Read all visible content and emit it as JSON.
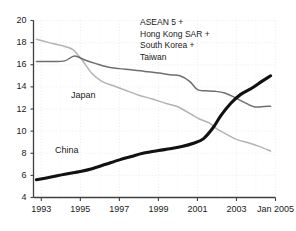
{
  "chart_data": {
    "type": "line",
    "title": "",
    "subtitle": "",
    "xlabel": "",
    "ylabel": "",
    "xlim": [
      1992.6,
      2005.0
    ],
    "ylim": [
      4,
      20
    ],
    "grid": true,
    "grid_style": "dotted",
    "legend_position": "inline-labels",
    "y_ticks": [
      "20",
      "18",
      "16",
      "14",
      "12",
      "10",
      "8",
      "6",
      "4"
    ],
    "y_tick_values": [
      20,
      18,
      16,
      14,
      12,
      10,
      8,
      6,
      4
    ],
    "x_ticks": [
      "1993",
      "1995",
      "1997",
      "1999",
      "2001",
      "2003",
      "Jan 2005"
    ],
    "x_tick_values": [
      1993,
      1995,
      1997,
      1999,
      2001,
      2003,
      2005
    ],
    "annotations": [
      {
        "name": "asean-group-annotation",
        "lines": [
          "ASEAN 5 +",
          "Hong Kong SAR +",
          "South Korea +",
          "Taiwan"
        ]
      }
    ],
    "series": [
      {
        "name": "China",
        "label": "China",
        "color": "#111111",
        "width": 3.1,
        "x": [
          1992.75,
          1993.5,
          1994.2,
          1995.0,
          1995.6,
          1996.3,
          1997.0,
          1997.6,
          1998.2,
          1999.0,
          1999.6,
          2000.2,
          2000.8,
          2001.3,
          2001.8,
          2002.2,
          2002.7,
          2003.2,
          2003.8,
          2004.3,
          2004.75
        ],
        "y": [
          5.6,
          5.85,
          6.1,
          6.35,
          6.6,
          7.0,
          7.4,
          7.7,
          8.0,
          8.25,
          8.4,
          8.6,
          8.9,
          9.3,
          10.3,
          11.4,
          12.5,
          13.3,
          13.9,
          14.5,
          15.0
        ]
      },
      {
        "name": "ASEAN 5 + Hong Kong SAR + South Korea + Taiwan",
        "label": "",
        "color": "#6e6e6e",
        "width": 1.5,
        "x": [
          1992.75,
          1993.5,
          1994.2,
          1994.7,
          1995.2,
          1995.8,
          1996.4,
          1997.0,
          1997.6,
          1998.3,
          1999.0,
          1999.6,
          2000.1,
          2000.6,
          2001.0,
          2001.4,
          2001.9,
          2002.4,
          2002.9,
          2003.4,
          2003.9,
          2004.3,
          2004.75
        ],
        "y": [
          16.3,
          16.3,
          16.35,
          16.8,
          16.45,
          16.1,
          15.8,
          15.65,
          15.55,
          15.4,
          15.25,
          15.1,
          15.0,
          14.5,
          13.75,
          13.65,
          13.6,
          13.45,
          13.05,
          12.6,
          12.2,
          12.2,
          12.25
        ]
      },
      {
        "name": "Japan",
        "label": "Japan",
        "color": "#b3b3b3",
        "width": 1.5,
        "x": [
          1992.75,
          1993.4,
          1994.0,
          1994.6,
          1995.1,
          1995.6,
          1996.1,
          1996.7,
          1997.3,
          1998.0,
          1998.7,
          1999.4,
          2000.0,
          2000.6,
          2001.1,
          2001.6,
          2002.0,
          2002.5,
          2003.0,
          2003.6,
          2004.2,
          2004.75
        ],
        "y": [
          18.3,
          18.0,
          17.75,
          17.4,
          16.4,
          15.2,
          14.5,
          14.1,
          13.7,
          13.25,
          12.9,
          12.5,
          12.2,
          11.6,
          11.1,
          10.75,
          10.2,
          9.7,
          9.25,
          8.95,
          8.6,
          8.2
        ]
      }
    ]
  }
}
